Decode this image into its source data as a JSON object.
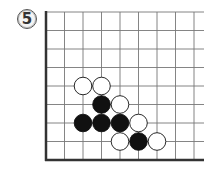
{
  "problem": {
    "number": "5"
  },
  "board": {
    "columns": 9,
    "rows": 9,
    "origin_x": 46,
    "bottom_y": 160,
    "spacing": 18.5,
    "line_top_y": 12,
    "line_right_x": 204,
    "edges": [
      "left",
      "bottom"
    ],
    "line_color": "#777777",
    "edge_color": "#333333"
  },
  "stones": [
    {
      "color": "white",
      "col": 2,
      "row": 4
    },
    {
      "color": "white",
      "col": 3,
      "row": 4
    },
    {
      "color": "black",
      "col": 3,
      "row": 3
    },
    {
      "color": "white",
      "col": 4,
      "row": 3
    },
    {
      "color": "black",
      "col": 2,
      "row": 2
    },
    {
      "color": "black",
      "col": 3,
      "row": 2
    },
    {
      "color": "black",
      "col": 4,
      "row": 2
    },
    {
      "color": "white",
      "col": 5,
      "row": 2
    },
    {
      "color": "white",
      "col": 4,
      "row": 1
    },
    {
      "color": "black",
      "col": 5,
      "row": 1
    },
    {
      "color": "white",
      "col": 6,
      "row": 1
    }
  ]
}
